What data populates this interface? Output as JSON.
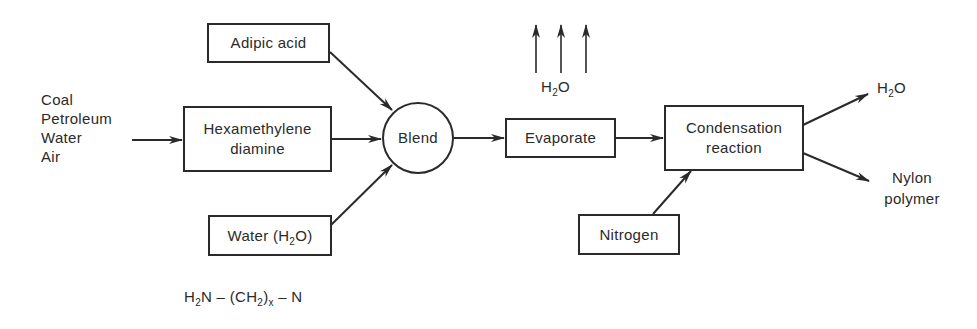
{
  "diagram": {
    "raw_materials": {
      "items": [
        "Coal",
        "Petroleum",
        "Water",
        "Air"
      ]
    },
    "nodes": {
      "adipic_acid": {
        "label": "Adipic acid"
      },
      "hexamethylene": {
        "line1": "Hexamethylene",
        "line2": "diamine"
      },
      "water": {
        "label_prefix": "Water (H",
        "sub": "2",
        "label_suffix": "O)"
      },
      "blend": {
        "label": "Blend"
      },
      "evaporate": {
        "label": "Evaporate"
      },
      "condensation": {
        "line1": "Condensation",
        "line2": "reaction"
      },
      "nitrogen": {
        "label": "Nitrogen"
      }
    },
    "outputs": {
      "vapor": {
        "prefix": "H",
        "sub": "2",
        "suffix": "O"
      },
      "water_out": {
        "prefix": "H",
        "sub": "2",
        "suffix": "O"
      },
      "nylon": {
        "line1": "Nylon",
        "line2": "polymer"
      }
    },
    "formula": {
      "part1": "H",
      "sub1": "2",
      "part2": "N – (CH",
      "sub2": "2",
      "part3": ")",
      "sub3": "x",
      "part4": " – N"
    },
    "edges": [
      {
        "from": "raw_materials",
        "to": "hexamethylene"
      },
      {
        "from": "adipic_acid",
        "to": "blend"
      },
      {
        "from": "hexamethylene",
        "to": "blend"
      },
      {
        "from": "water",
        "to": "blend"
      },
      {
        "from": "blend",
        "to": "evaporate"
      },
      {
        "from": "evaporate",
        "to": "vapor"
      },
      {
        "from": "evaporate",
        "to": "condensation"
      },
      {
        "from": "nitrogen",
        "to": "condensation"
      },
      {
        "from": "condensation",
        "to": "water_out"
      },
      {
        "from": "condensation",
        "to": "nylon"
      }
    ],
    "colors": {
      "ink": "#2a2a2a",
      "background": "#ffffff"
    }
  }
}
